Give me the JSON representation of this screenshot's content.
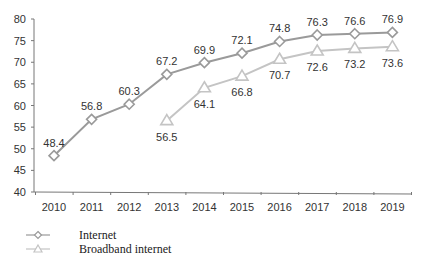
{
  "chart_data": {
    "type": "line",
    "title": "",
    "xlabel": "",
    "ylabel": "",
    "x": [
      "2010",
      "2011",
      "2012",
      "2013",
      "2014",
      "2015",
      "2016",
      "2017",
      "2018",
      "2019"
    ],
    "ylim": [
      40,
      80
    ],
    "yticks": [
      40,
      45,
      50,
      55,
      60,
      65,
      70,
      75,
      80
    ],
    "grid": false,
    "legend_position": "bottom-left",
    "series": [
      {
        "name": "Internet",
        "marker": "diamond",
        "color": "#9a9a9a",
        "values": [
          48.4,
          56.8,
          60.3,
          67.2,
          69.9,
          72.1,
          74.8,
          76.3,
          76.6,
          76.9
        ]
      },
      {
        "name": "Broadband internet",
        "marker": "triangle",
        "color": "#c4c4c4",
        "values": [
          null,
          null,
          null,
          56.5,
          64.1,
          66.8,
          70.7,
          72.6,
          73.2,
          73.6
        ]
      }
    ]
  },
  "legend": {
    "items": [
      {
        "label": "Internet"
      },
      {
        "label": "Broadband internet"
      }
    ]
  }
}
